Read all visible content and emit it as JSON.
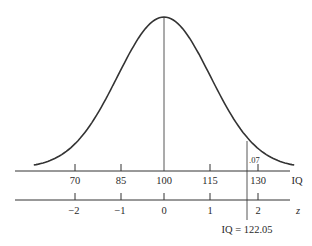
{
  "chart_data": {
    "type": "line",
    "title": "",
    "mean": 100,
    "sd": 15,
    "axes": [
      {
        "name": "IQ",
        "label": "IQ",
        "ticks": [
          70,
          85,
          100,
          115,
          130
        ],
        "tick_labels": [
          "70",
          "85",
          "100",
          "115",
          "130"
        ]
      },
      {
        "name": "z",
        "label": "z",
        "ticks": [
          -2,
          -1,
          0,
          1,
          2
        ],
        "tick_labels": [
          "−2",
          "−1",
          "0",
          "1",
          "2"
        ]
      }
    ],
    "annotations": [
      {
        "text": ".07",
        "meaning": "tail area to the right of cutoff"
      },
      {
        "text": "IQ = 122.05",
        "meaning": "cutoff value"
      }
    ],
    "cutoff_iq": 122.05,
    "tail_area": 0.07,
    "xlabel": "IQ",
    "ylabel": "",
    "grid": false
  },
  "labels": {
    "iq_axis": "IQ",
    "z_axis": "z",
    "iq_ticks": [
      "70",
      "85",
      "100",
      "115",
      "130"
    ],
    "z_ticks": [
      "−2",
      "−1",
      "0",
      "1",
      "2"
    ],
    "tail_area": ".07",
    "cutoff": "IQ = 122.05"
  }
}
